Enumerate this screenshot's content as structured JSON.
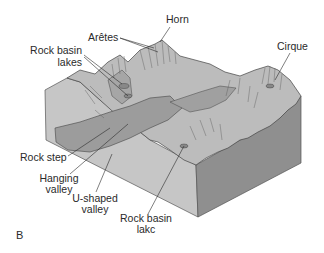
{
  "figure": {
    "panel_label": "B",
    "labels": {
      "horn": "Horn",
      "aretes": "Arêtes",
      "rock_basin_lakes_1": "Rock basin",
      "rock_basin_lakes_2": "lakes",
      "cirque": "Cirque",
      "rock_step": "Rock step",
      "hanging_valley_1": "Hanging",
      "hanging_valley_2": "valley",
      "u_shaped_valley_1": "U-shaped",
      "u_shaped_valley_2": "valley",
      "rock_basin_lake_1": "Rock basin",
      "rock_basin_lake_2": "lakc"
    },
    "colors": {
      "background": "#ffffff",
      "left_face": "#c4c4c4",
      "right_face": "#8e8e8e",
      "terrain": "#bdbdbd",
      "valley_shade": "#9a9a9a",
      "line": "#3a3a3a"
    }
  }
}
